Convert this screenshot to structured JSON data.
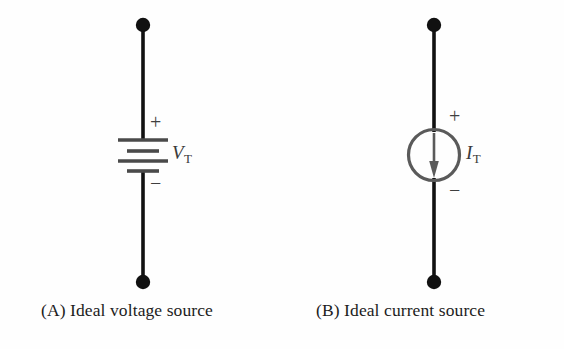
{
  "figure": {
    "background_color": "#fefefe",
    "wire_color": "#111111",
    "symbol_color": "#4a4a4a",
    "text_color": "#1c1c1c"
  },
  "panels": [
    {
      "id": "a",
      "caption": "(A) Ideal voltage source",
      "symbol": "battery",
      "symbol_name": "ideal-voltage-source",
      "label_variable": "V",
      "label_subscript": "T",
      "polarity_plus": "+",
      "polarity_minus": "−",
      "terminal_top": "node-dot",
      "terminal_bottom": "node-dot",
      "plate_count": 4
    },
    {
      "id": "b",
      "caption": "(B) Ideal current source",
      "symbol": "circle-with-down-arrow",
      "symbol_name": "ideal-current-source",
      "label_variable": "I",
      "label_subscript": "T",
      "polarity_plus": "+",
      "polarity_minus": "−",
      "terminal_top": "node-dot",
      "terminal_bottom": "node-dot",
      "arrow_direction": "down"
    }
  ]
}
